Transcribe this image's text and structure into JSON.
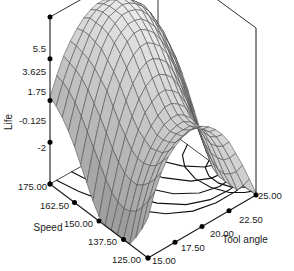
{
  "chart_data": {
    "type": "surface3d",
    "title": "",
    "zlabel": "Life",
    "xlabel": "Speed",
    "ylabel": "Tool angle",
    "zticks": [
      "5.5",
      "3.625",
      "1.75",
      "-0.125",
      "-2"
    ],
    "zvalues": [
      5.5,
      3.625,
      1.75,
      -0.125,
      -2
    ],
    "zlim": [
      -2,
      5.5
    ],
    "xticks": [
      "175.00",
      "162.50",
      "150.00",
      "137.50",
      "125.00"
    ],
    "xvalues": [
      175.0,
      162.5,
      150.0,
      137.5,
      125.0
    ],
    "xlim": [
      125.0,
      175.0
    ],
    "yticks": [
      "15.00",
      "17.50",
      "20.00",
      "22.50",
      "25.00"
    ],
    "yvalues": [
      15.0,
      17.5,
      20.0,
      22.5,
      25.0
    ],
    "ylim": [
      15.0,
      25.0
    ],
    "grid": true,
    "legend": "none",
    "surface_color": "#c9c9c9",
    "mesh_color": "#4a4a4a",
    "axis_color": "#1a1a1a",
    "contour_projection": true,
    "mesh_rows": 17,
    "mesh_cols": 17,
    "surface_note": "saddle-shaped response surface, ridge high at back, dipping to low trough at front-center",
    "grid_z": [
      [
        1.9,
        2.7,
        3.4,
        3.9,
        4.3,
        4.6,
        4.8,
        4.9,
        4.9,
        4.8,
        4.7,
        4.5,
        4.2,
        3.8,
        3.3,
        2.7,
        2.0
      ],
      [
        1.7,
        2.6,
        3.3,
        3.9,
        4.4,
        4.8,
        5.0,
        5.1,
        5.1,
        5.0,
        4.9,
        4.6,
        4.3,
        3.9,
        3.4,
        2.7,
        2.0
      ],
      [
        1.4,
        2.4,
        3.2,
        3.8,
        4.4,
        4.8,
        5.1,
        5.2,
        5.3,
        5.2,
        5.0,
        4.7,
        4.4,
        3.9,
        3.3,
        2.6,
        1.8
      ],
      [
        1.0,
        2.1,
        3.0,
        3.7,
        4.3,
        4.8,
        5.1,
        5.2,
        5.3,
        5.2,
        5.0,
        4.7,
        4.3,
        3.7,
        3.1,
        2.3,
        1.5
      ],
      [
        0.5,
        1.7,
        2.7,
        3.5,
        4.2,
        4.7,
        5.0,
        5.2,
        5.2,
        5.1,
        4.9,
        4.5,
        4.0,
        3.4,
        2.7,
        1.9,
        1.0
      ],
      [
        -0.1,
        1.2,
        2.3,
        3.2,
        3.9,
        4.5,
        4.8,
        5.0,
        5.0,
        4.9,
        4.6,
        4.2,
        3.6,
        2.9,
        2.2,
        1.3,
        0.4
      ],
      [
        -0.7,
        0.7,
        1.9,
        2.9,
        3.6,
        4.2,
        4.6,
        4.8,
        4.8,
        4.6,
        4.3,
        3.8,
        3.2,
        2.4,
        1.6,
        0.7,
        -0.3
      ],
      [
        -1.3,
        0.2,
        1.4,
        2.4,
        3.2,
        3.8,
        4.2,
        4.4,
        4.4,
        4.2,
        3.9,
        3.4,
        2.7,
        1.9,
        1.0,
        0.0,
        -1.0
      ],
      [
        -1.8,
        -0.3,
        0.9,
        1.9,
        2.7,
        3.3,
        3.7,
        3.9,
        3.9,
        3.7,
        3.4,
        2.8,
        2.1,
        1.3,
        0.3,
        -0.7,
        -1.7
      ],
      [
        -2.2,
        -0.7,
        0.5,
        1.5,
        2.2,
        2.8,
        3.2,
        3.4,
        3.4,
        3.2,
        2.9,
        2.3,
        1.6,
        0.7,
        -0.3,
        -1.3,
        -2.3
      ],
      [
        -2.4,
        -0.9,
        0.2,
        1.1,
        1.8,
        2.4,
        2.7,
        2.9,
        2.9,
        2.7,
        2.4,
        1.8,
        1.1,
        0.2,
        -0.8,
        -1.8,
        -2.8
      ],
      [
        -2.4,
        -1.0,
        0.1,
        0.9,
        1.6,
        2.0,
        2.3,
        2.5,
        2.5,
        2.3,
        2.0,
        1.4,
        0.7,
        -0.2,
        -1.1,
        -2.1,
        -3.1
      ],
      [
        -2.3,
        -0.9,
        0.1,
        0.9,
        1.4,
        1.8,
        2.1,
        2.2,
        2.2,
        2.0,
        1.7,
        1.2,
        0.5,
        -0.4,
        -1.3,
        -2.2,
        -3.2
      ],
      [
        -2.0,
        -0.7,
        0.3,
        1.0,
        1.5,
        1.8,
        2.0,
        2.1,
        2.1,
        1.9,
        1.6,
        1.1,
        0.4,
        -0.4,
        -1.3,
        -2.2,
        -3.1
      ],
      [
        -1.5,
        -0.3,
        0.6,
        1.2,
        1.6,
        1.9,
        2.1,
        2.1,
        2.1,
        1.9,
        1.6,
        1.1,
        0.5,
        -0.3,
        -1.1,
        -2.0,
        -2.8
      ],
      [
        -0.9,
        0.2,
        1.0,
        1.6,
        1.9,
        2.1,
        2.2,
        2.3,
        2.2,
        2.0,
        1.7,
        1.3,
        0.7,
        0.0,
        -0.8,
        -1.6,
        -2.4
      ],
      [
        -0.2,
        0.8,
        1.5,
        2.0,
        2.3,
        2.5,
        2.6,
        2.6,
        2.5,
        2.3,
        2.0,
        1.6,
        1.1,
        0.4,
        -0.3,
        -1.1,
        -1.9
      ]
    ]
  },
  "axes": {
    "z": {
      "title": "Life",
      "ticks": [
        "5.5",
        "3.625",
        "1.75",
        "-0.125",
        "-2"
      ]
    },
    "x": {
      "title": "Speed",
      "ticks": [
        "175.00",
        "162.50",
        "150.00",
        "137.50",
        "125.00"
      ]
    },
    "y": {
      "title": "Tool angle",
      "ticks": [
        "15.00",
        "17.50",
        "20.00",
        "22.50",
        "25.00"
      ]
    }
  }
}
